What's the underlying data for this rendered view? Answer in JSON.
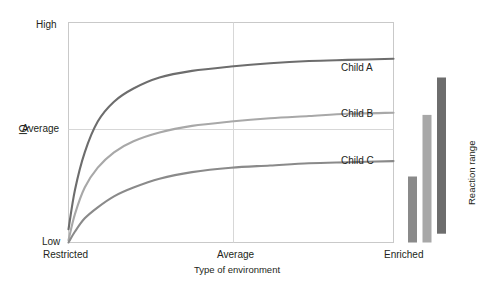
{
  "chart_data": {
    "type": "line",
    "title": "",
    "xlabel": "Type of environment",
    "ylabel": "IQ",
    "x_tick_labels": [
      "Restricted",
      "Average",
      "Enriched"
    ],
    "y_tick_labels": [
      "Low",
      "Average",
      "High"
    ],
    "ylim": [
      0,
      100
    ],
    "xlim": [
      0,
      100
    ],
    "grid": true,
    "legend": "inline-end-labels",
    "series": [
      {
        "name": "Child A",
        "color": "#6d6d6d",
        "x": [
          0,
          2,
          5,
          9,
          14,
          20,
          28,
          38,
          50,
          62,
          74,
          86,
          100
        ],
        "y": [
          6,
          24,
          41,
          55,
          64,
          70,
          75,
          78,
          80,
          81.5,
          82.5,
          83,
          83.5
        ]
      },
      {
        "name": "Child B",
        "color": "#a8a8a8",
        "x": [
          0,
          2,
          5,
          9,
          14,
          20,
          28,
          38,
          50,
          62,
          74,
          86,
          100
        ],
        "y": [
          1,
          13,
          25,
          34,
          41,
          46,
          50,
          53,
          55,
          56.5,
          57.5,
          58.5,
          59
        ]
      },
      {
        "name": "Child C",
        "color": "#8a8a8a",
        "x": [
          0,
          2,
          5,
          9,
          14,
          20,
          28,
          38,
          50,
          62,
          74,
          86,
          100
        ],
        "y": [
          0,
          5,
          11,
          16,
          21,
          25,
          29,
          32,
          34,
          35,
          36,
          36.5,
          37
        ]
      }
    ],
    "reaction_range": {
      "label": "Reaction range",
      "bars": [
        {
          "name": "Child C range",
          "color": "#8a8a8a",
          "bottom": 0,
          "top": 30
        },
        {
          "name": "Child B range",
          "color": "#a8a8a8",
          "bottom": 0,
          "top": 58
        },
        {
          "name": "Child A range",
          "color": "#6d6d6d",
          "bottom": 4,
          "top": 75
        }
      ]
    },
    "colors": {
      "frame": "#c9c9c9",
      "gridline": "#d7d7d7",
      "text": "#231f20"
    }
  },
  "axis": {
    "y_high": "High",
    "y_average": "Average",
    "y_low": "Low",
    "y_title": "IQ",
    "x_restricted": "Restricted",
    "x_average": "Average",
    "x_enriched": "Enriched",
    "x_title": "Type of environment"
  },
  "curve_labels": {
    "a": "Child A",
    "b": "Child B",
    "c": "Child C"
  },
  "reaction_range_title": "Reaction range"
}
